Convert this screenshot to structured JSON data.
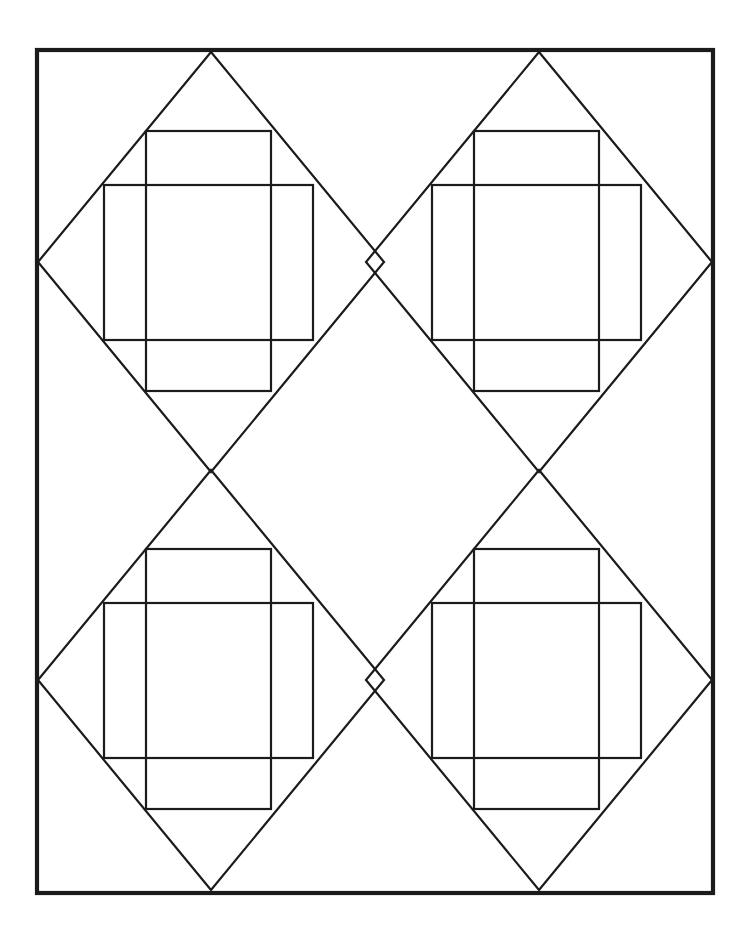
{
  "document": {
    "title": "Geometric Line Drawing",
    "description": "Black-and-white geometric line figure: a rectangular border enclosing a two-by-two arrangement of overlapping diamonds, each containing two overlapping inscribed rectangles.",
    "canvas": {
      "width": 755,
      "height": 937
    },
    "background_color": "#ffffff",
    "ink_color": "#1b1b1b"
  },
  "figure": {
    "border": {
      "name": "outer-border",
      "x": 37,
      "y": 50,
      "width": 676,
      "height": 843,
      "stroke_width": 4.2
    },
    "diamond_grid": {
      "columns": 2,
      "rows": 2,
      "center_x": [
        211,
        539
      ],
      "center_y": [
        262,
        680
      ],
      "half_width": 173,
      "half_height": 210,
      "stroke_width": 2.2
    },
    "diamonds": [
      {
        "name": "diamond-top-left",
        "cx": 211,
        "cy": 262,
        "top": [
          211,
          52
        ],
        "right": [
          384,
          262
        ],
        "bottom": [
          211,
          472
        ],
        "left": [
          38,
          262
        ]
      },
      {
        "name": "diamond-top-right",
        "cx": 539,
        "cy": 262,
        "top": [
          539,
          52
        ],
        "right": [
          712,
          262
        ],
        "bottom": [
          539,
          472
        ],
        "left": [
          366,
          262
        ]
      },
      {
        "name": "diamond-bottom-left",
        "cx": 211,
        "cy": 680,
        "top": [
          211,
          470
        ],
        "right": [
          384,
          680
        ],
        "bottom": [
          211,
          890
        ],
        "left": [
          38,
          680
        ]
      },
      {
        "name": "diamond-bottom-right",
        "cx": 539,
        "cy": 680,
        "top": [
          539,
          470
        ],
        "right": [
          712,
          680
        ],
        "bottom": [
          539,
          890
        ],
        "left": [
          366,
          680
        ]
      }
    ],
    "inner_rectangles": [
      {
        "name": "rect-tall-top-left",
        "orientation": "tall",
        "x": 146,
        "y": 131,
        "width": 125,
        "height": 260
      },
      {
        "name": "rect-wide-top-left",
        "orientation": "wide",
        "x": 104,
        "y": 185,
        "width": 209,
        "height": 155
      },
      {
        "name": "rect-tall-top-right",
        "orientation": "tall",
        "x": 474,
        "y": 131,
        "width": 125,
        "height": 260
      },
      {
        "name": "rect-wide-top-right",
        "orientation": "wide",
        "x": 432,
        "y": 185,
        "width": 209,
        "height": 155
      },
      {
        "name": "rect-tall-bottom-left",
        "orientation": "tall",
        "x": 146,
        "y": 549,
        "width": 125,
        "height": 260
      },
      {
        "name": "rect-wide-bottom-left",
        "orientation": "wide",
        "x": 104,
        "y": 603,
        "width": 209,
        "height": 155
      },
      {
        "name": "rect-tall-bottom-right",
        "orientation": "tall",
        "x": 474,
        "y": 549,
        "width": 125,
        "height": 260
      },
      {
        "name": "rect-wide-bottom-right",
        "orientation": "wide",
        "x": 432,
        "y": 603,
        "width": 209,
        "height": 155
      }
    ],
    "crossing_points": [
      {
        "name": "crossing-center-upper",
        "x": 375,
        "y": 262
      },
      {
        "name": "crossing-center-lower",
        "x": 375,
        "y": 680
      },
      {
        "name": "crossing-left-middle",
        "x": 209,
        "y": 471
      },
      {
        "name": "crossing-right-middle",
        "x": 539,
        "y": 471
      }
    ]
  }
}
